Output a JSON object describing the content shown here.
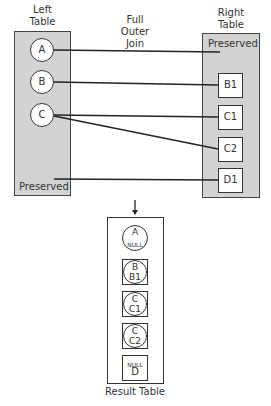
{
  "title": "Full Outer Join",
  "title_lines": [
    "Full",
    "Outer",
    "Join"
  ],
  "left_table": {
    "label_lines": [
      "Left",
      "Table"
    ],
    "rows": [
      "A",
      "B",
      "C"
    ],
    "preserved_label": "Preserved"
  },
  "right_table": {
    "label_lines": [
      "Right",
      "Table"
    ],
    "preserved_label": "Preserved",
    "rows": [
      "B1",
      "C1",
      "C2",
      "D1"
    ]
  },
  "connections": [
    {
      "from": "A",
      "to": "Right Preserved"
    },
    {
      "from": "B",
      "to": "B1"
    },
    {
      "from": "C",
      "to": "C1"
    },
    {
      "from": "C",
      "to": "C2"
    },
    {
      "from": "Left Preserved",
      "to": "D1"
    }
  ],
  "result_table": {
    "label": "Result Table",
    "rows": [
      {
        "left": "A",
        "right": "NULL"
      },
      {
        "left": "B",
        "right": "B1"
      },
      {
        "left": "C",
        "right": "C1"
      },
      {
        "left": "C",
        "right": "C2"
      },
      {
        "left": "NULL",
        "right": "D"
      }
    ]
  },
  "colors": {
    "table_fill": "#d3d3d3",
    "stroke": "#333333",
    "background": "#ffffff"
  }
}
